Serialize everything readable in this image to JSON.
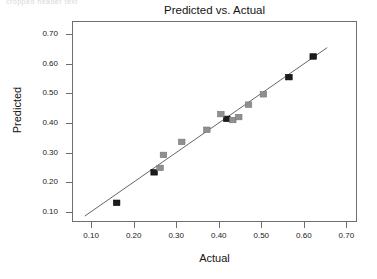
{
  "artifact": {
    "top_fragment": "cropped header text"
  },
  "labels": {
    "title": "Predicted vs. Actual",
    "xlabel": "Actual",
    "ylabel": "Predicted"
  },
  "axes": {
    "x_ticks": [
      "0.10",
      "0.20",
      "0.30",
      "0.40",
      "0.50",
      "0.60",
      "0.70"
    ],
    "y_ticks": [
      "0.70",
      "0.60",
      "0.50",
      "0.40",
      "0.30",
      "0.20",
      "0.10"
    ]
  },
  "colors": {
    "frame": "#6f6f6f",
    "line": "#555555",
    "marker_dark": "#1c1c1c",
    "marker_gray": "#8f8f8f",
    "text": "#141414"
  },
  "chart_data": {
    "type": "scatter",
    "title": "Predicted vs. Actual",
    "xlabel": "Actual",
    "ylabel": "Predicted",
    "xlim": [
      0.055,
      0.725
    ],
    "ylim": [
      0.065,
      0.745
    ],
    "xticks": [
      0.1,
      0.2,
      0.3,
      0.4,
      0.5,
      0.6,
      0.7
    ],
    "yticks": [
      0.1,
      0.2,
      0.3,
      0.4,
      0.5,
      0.6,
      0.7
    ],
    "grid": false,
    "legend": "none",
    "reference_line": {
      "type": "line",
      "label": "identity / fit line",
      "x": [
        0.085,
        0.655
      ],
      "y": [
        0.085,
        0.655
      ],
      "color": "#555555"
    },
    "series": [
      {
        "name": "dark markers",
        "color": "#1c1c1c",
        "marker": "square",
        "points": [
          {
            "x": 0.16,
            "y": 0.13
          },
          {
            "x": 0.248,
            "y": 0.233
          },
          {
            "x": 0.419,
            "y": 0.414
          },
          {
            "x": 0.565,
            "y": 0.555
          },
          {
            "x": 0.622,
            "y": 0.625
          }
        ]
      },
      {
        "name": "gray markers",
        "color": "#8f8f8f",
        "marker": "square",
        "points": [
          {
            "x": 0.262,
            "y": 0.248
          },
          {
            "x": 0.27,
            "y": 0.292
          },
          {
            "x": 0.313,
            "y": 0.336
          },
          {
            "x": 0.372,
            "y": 0.377
          },
          {
            "x": 0.405,
            "y": 0.43
          },
          {
            "x": 0.433,
            "y": 0.41
          },
          {
            "x": 0.447,
            "y": 0.42
          },
          {
            "x": 0.47,
            "y": 0.462
          },
          {
            "x": 0.505,
            "y": 0.497
          }
        ]
      }
    ]
  }
}
